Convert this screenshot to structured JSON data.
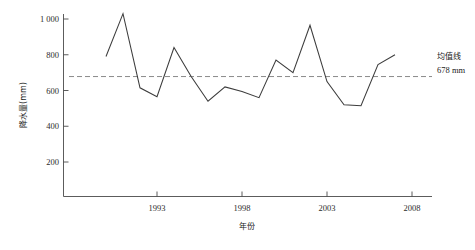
{
  "chart_data": {
    "type": "line",
    "title": "",
    "xlabel": "年份",
    "ylabel": "降水量(mm)",
    "x": [
      1990,
      1991,
      1992,
      1993,
      1994,
      1995,
      1996,
      1997,
      1998,
      1999,
      2000,
      2001,
      2002,
      2003,
      2004,
      2005,
      2006,
      2007
    ],
    "values": [
      790,
      1030,
      615,
      565,
      840,
      680,
      540,
      620,
      595,
      560,
      770,
      700,
      965,
      650,
      520,
      515,
      745,
      800
    ],
    "series": [
      {
        "name": "降水量",
        "values": [
          790,
          1030,
          615,
          565,
          840,
          680,
          540,
          620,
          595,
          560,
          770,
          700,
          965,
          650,
          520,
          515,
          745,
          800
        ]
      }
    ],
    "xlim": [
      1988.5,
      2009
    ],
    "ylim": [
      0,
      1060
    ],
    "xticks": [
      1993,
      1998,
      2003,
      2008
    ],
    "xtick_labels": [
      "1993",
      "1998",
      "2003",
      "2008"
    ],
    "yticks": [
      200,
      400,
      600,
      800,
      1000
    ],
    "ytick_labels": [
      "200",
      "400",
      "600",
      "800",
      "1 000"
    ],
    "grid": false,
    "legend": "none",
    "annotations": [
      {
        "name": "mean-line",
        "label": "均值线",
        "value_label": "678 mm",
        "value": 678,
        "style": "dashed-horizontal"
      }
    ],
    "colors": {
      "line": "#3c3c3c",
      "mean_line": "#8a8a8a",
      "axis": "#4a4a4a",
      "background": "#ffffff",
      "text": "#1a1a1a"
    }
  },
  "axes": {
    "y_title": "降水量(mm)",
    "x_title": "年份",
    "y_tick_labels": [
      "1 000",
      "800",
      "600",
      "400",
      "200"
    ],
    "x_tick_labels": [
      "1993",
      "1998",
      "2003",
      "2008"
    ]
  },
  "annotation": {
    "mean_label": "均值线",
    "mean_value": "678 mm"
  }
}
